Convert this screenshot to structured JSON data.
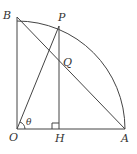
{
  "diagram": {
    "type": "geometry",
    "points": {
      "O": {
        "label": "O",
        "x": 17,
        "y": 129
      },
      "A": {
        "label": "A",
        "x": 125,
        "y": 129
      },
      "B": {
        "label": "B",
        "x": 17,
        "y": 17
      },
      "P": {
        "label": "P",
        "x": 59,
        "y": 26
      },
      "H": {
        "label": "H",
        "x": 59,
        "y": 129
      },
      "Q": {
        "label": "Q",
        "x": 59,
        "y": 86
      }
    },
    "angle_label": "θ",
    "segments": [
      "OA",
      "OB",
      "AB",
      "OP",
      "PH"
    ],
    "arc": "BA",
    "right_angle_at": "H",
    "colors": {
      "line": "#444444",
      "text": "#333333",
      "background": "#ffffff"
    }
  }
}
